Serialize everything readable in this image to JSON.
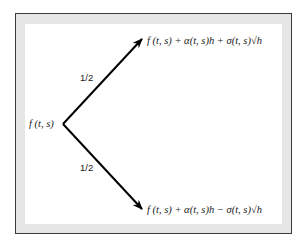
{
  "diagram": {
    "type": "binomial-tree",
    "origin_label": "f (t, s)",
    "branches": [
      {
        "probability_label": "1/2",
        "target_label": "f (t, s) + α(t, s)h + σ(t, s)√h",
        "direction": "up"
      },
      {
        "probability_label": "1/2",
        "target_label": "f (t, s) + α(t, s)h − σ(t, s)√h",
        "direction": "down"
      }
    ],
    "colors": {
      "line": "#000000",
      "frame_border": "#3a3a3a",
      "frame_fill": "#e6e6e6",
      "background": "#ffffff"
    }
  }
}
